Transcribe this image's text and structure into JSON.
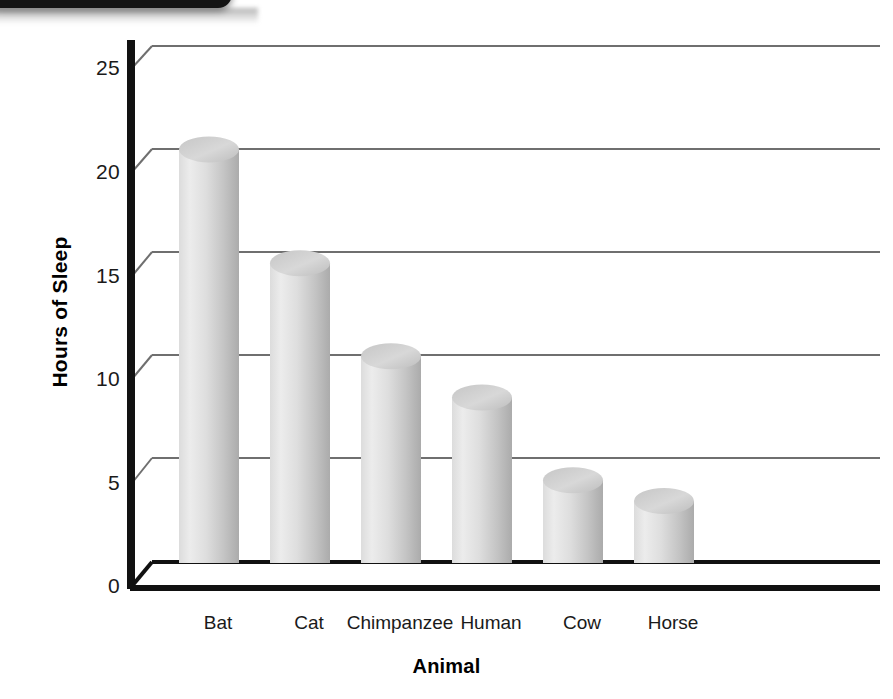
{
  "banner": {
    "name": "top-banner-cut-off",
    "color": "#141414"
  },
  "chart_data": {
    "type": "bar",
    "title": "",
    "subtitle": "",
    "xlabel": "Animal",
    "ylabel": "Hours of Sleep",
    "categories": [
      "Bat",
      "Cat",
      "Chimpanzee",
      "Human",
      "Cow",
      "Horse"
    ],
    "values": [
      20,
      14.5,
      10,
      8,
      4,
      3
    ],
    "ylim": [
      0,
      25
    ],
    "yticks": [
      0,
      5,
      10,
      15,
      20,
      25
    ],
    "ytick_labels": [
      "0",
      "5",
      "10",
      "15",
      "20",
      "25"
    ],
    "grid": true,
    "grid_axis": "y",
    "legend": false,
    "legend_position": "none",
    "style": "3d-cylinder-bars",
    "bar_color_light": "#e9e9e9",
    "bar_color_mid": "#d2d2d2",
    "bar_color_dark": "#b0b0b0",
    "axis_color": "#000000",
    "grid_color": "#6f6f6f"
  }
}
